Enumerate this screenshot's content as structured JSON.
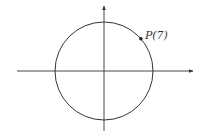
{
  "diagram": {
    "type": "unit-circle",
    "point": {
      "label": "P(7)",
      "angle_radians": 7
    },
    "axes": {
      "x_arrow": true,
      "y_arrow": true
    },
    "colors": {
      "stroke": "#333333",
      "background": "#ffffff"
    }
  }
}
